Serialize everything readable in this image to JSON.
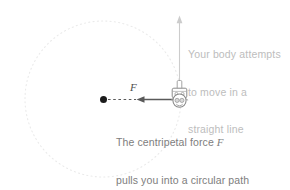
{
  "figure": {
    "title_hidden": "",
    "background_color": "#ffffff",
    "circle": {
      "name": "circular-path",
      "style": "dotted",
      "color": "#e8e8e8",
      "center_x": 103,
      "center_y": 99,
      "radius": 78
    },
    "center_dot": {
      "name": "circle-center-dot",
      "color": "#1a1a1a",
      "x": 103,
      "y": 99,
      "radius": 3.4
    },
    "rider": {
      "name": "rider-figure",
      "x": 179,
      "y": 98,
      "color": "#8c8c8c"
    },
    "tangent_arrow": {
      "name": "tangent-velocity-arrow",
      "color": "#c9c9c9",
      "from_x": 179,
      "from_y": 94,
      "to_x": 179,
      "to_y": 17
    },
    "force_arrow": {
      "name": "centripetal-force-arrow",
      "color": "#555555",
      "from_x": 176,
      "from_y": 99,
      "to_x": 137,
      "to_y": 99
    },
    "radius_dashes": {
      "name": "radius-dashed-segment",
      "color": "#555555",
      "from_x": 108,
      "from_y": 99,
      "to_x": 137,
      "to_y": 99
    }
  },
  "labels": {
    "force_symbol": "F",
    "straight_line_note": {
      "line1": "Your body attempts",
      "line2": "to move in a",
      "line3": "straight line",
      "color": "#bdbdbd"
    },
    "caption": {
      "line1_before_symbol": "The centripetal force ",
      "line1_symbol": "F",
      "line2": "pulls you into a circular path",
      "color": "#7d7d7d"
    }
  }
}
